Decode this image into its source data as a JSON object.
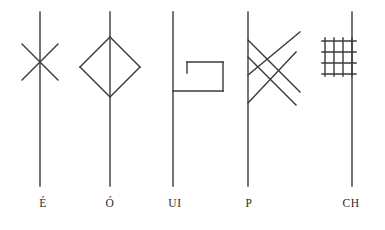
{
  "figure": {
    "kind": "runic-glyph-chart",
    "background_color": "#ffffff",
    "stroke_color": "#3a3a3a",
    "stroke_width": 1.4,
    "width": 385,
    "height": 230
  },
  "glyphs": [
    {
      "id": "glyph-e-acute",
      "label": "É",
      "label_x": 43,
      "stave": {
        "x": 40,
        "y1": 12,
        "y2": 186
      },
      "strokes": [
        {
          "name": "x-stroke-down-right",
          "x1": 22,
          "y1": 44,
          "x2": 58,
          "y2": 80
        },
        {
          "name": "x-stroke-up-right",
          "x1": 22,
          "y1": 80,
          "x2": 58,
          "y2": 44
        }
      ]
    },
    {
      "id": "glyph-o-acute",
      "label": "Ó",
      "label_x": 110,
      "stave": {
        "x": 110,
        "y1": 12,
        "y2": 186
      },
      "strokes": [
        {
          "name": "diamond-upper-left",
          "x1": 110,
          "y1": 37,
          "x2": 80,
          "y2": 67
        },
        {
          "name": "diamond-lower-left",
          "x1": 80,
          "y1": 67,
          "x2": 110,
          "y2": 97
        },
        {
          "name": "diamond-lower-right",
          "x1": 110,
          "y1": 97,
          "x2": 140,
          "y2": 67
        },
        {
          "name": "diamond-upper-right",
          "x1": 140,
          "y1": 67,
          "x2": 110,
          "y2": 37
        }
      ]
    },
    {
      "id": "glyph-ui",
      "label": "UI",
      "label_x": 175,
      "stave": {
        "x": 173,
        "y1": 12,
        "y2": 186
      },
      "strokes": [
        {
          "name": "box-top",
          "x1": 187,
          "y1": 62,
          "x2": 223,
          "y2": 62
        },
        {
          "name": "box-right",
          "x1": 223,
          "y1": 62,
          "x2": 223,
          "y2": 91
        },
        {
          "name": "box-bottom",
          "x1": 223,
          "y1": 91,
          "x2": 173,
          "y2": 91
        },
        {
          "name": "box-inner-stub",
          "x1": 187,
          "y1": 62,
          "x2": 187,
          "y2": 73
        }
      ]
    },
    {
      "id": "glyph-p",
      "label": "P",
      "label_x": 249,
      "stave": {
        "x": 248,
        "y1": 12,
        "y2": 186
      },
      "strokes": [
        {
          "name": "diagonal-down-1",
          "x1": 248,
          "y1": 40,
          "x2": 300,
          "y2": 92
        },
        {
          "name": "diagonal-down-2",
          "x1": 248,
          "y1": 57,
          "x2": 296,
          "y2": 105
        },
        {
          "name": "diagonal-up-1",
          "x1": 248,
          "y1": 75,
          "x2": 300,
          "y2": 32
        },
        {
          "name": "diagonal-up-2",
          "x1": 248,
          "y1": 103,
          "x2": 296,
          "y2": 52
        }
      ]
    },
    {
      "id": "glyph-ch",
      "label": "CH",
      "label_x": 351,
      "stave": {
        "x": 352,
        "y1": 12,
        "y2": 186
      },
      "grid": {
        "name": "lattice",
        "x_left": 322,
        "x_right": 356,
        "y_top": 38,
        "y_bottom": 76,
        "verticals": [
          325,
          334,
          343,
          352
        ],
        "horizontals": [
          41,
          52,
          63,
          74
        ]
      }
    }
  ],
  "labels": {
    "items": [
      {
        "text": "É",
        "x": 43
      },
      {
        "text": "Ó",
        "x": 110
      },
      {
        "text": "UI",
        "x": 175
      },
      {
        "text": "P",
        "x": 249
      },
      {
        "text": "CH",
        "x": 351
      }
    ]
  }
}
